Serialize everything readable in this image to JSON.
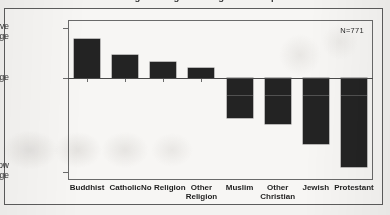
{
  "figure": {
    "title_cutoff": "Average Ratings of Religious Groups",
    "annotation": "N=771",
    "frame_color": "#5c5c5c",
    "bar_color": "#232323"
  },
  "axis": {
    "y_top_label": "Above\nAverage",
    "y_mid_label": "Average",
    "y_bottom_label": "Below\nAverage"
  },
  "chart_data": {
    "type": "bar",
    "title": "Average Ratings of Religious Groups",
    "xlabel": "",
    "ylabel": "",
    "categories": [
      "Buddhist",
      "Catholic",
      "No Religion",
      "Other\nReligion",
      "Muslim",
      "Other\nChristian",
      "Jewish",
      "Protestant"
    ],
    "values": [
      1.0,
      0.59,
      0.41,
      0.26,
      -1.03,
      -1.18,
      -1.69,
      -2.28
    ],
    "ylim": [
      -2.6,
      1.28
    ],
    "ytick_values": [
      1.28,
      0,
      -2.42
    ],
    "ytick_labels": [
      "Above Average",
      "Average",
      "Below Average"
    ],
    "grid": false,
    "legend": null,
    "annotations": [
      "N=771"
    ],
    "sample_size": 771,
    "zero_reference_line": true,
    "orientation": "vertical"
  }
}
